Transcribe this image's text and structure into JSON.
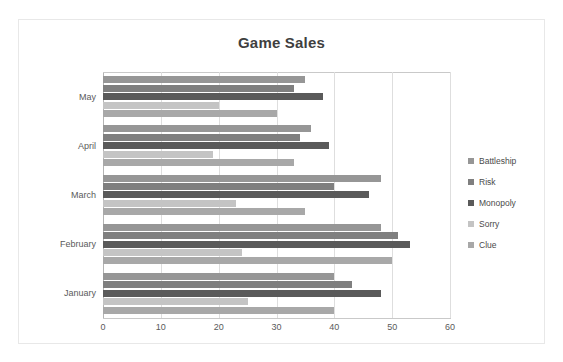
{
  "chart_data": {
    "type": "bar",
    "orientation": "horizontal",
    "title": "Game Sales",
    "xlabel": "",
    "ylabel": "",
    "categories": [
      "January",
      "February",
      "March",
      "April",
      "May"
    ],
    "category_order_top_to_bottom": [
      "May",
      "April",
      "March",
      "February",
      "January"
    ],
    "series": [
      {
        "name": "Battleship",
        "color": "#969696",
        "values": [
          40,
          48,
          48,
          36,
          35
        ]
      },
      {
        "name": "Risk",
        "color": "#7f7f7f",
        "values": [
          43,
          51,
          40,
          34,
          33
        ]
      },
      {
        "name": "Monopoly",
        "color": "#5a5a5a",
        "values": [
          48,
          53,
          46,
          39,
          38
        ]
      },
      {
        "name": "Sorry",
        "color": "#c4c4c4",
        "values": [
          25,
          24,
          23,
          19,
          20
        ]
      },
      {
        "name": "Clue",
        "color": "#a8a8a8",
        "values": [
          40,
          50,
          35,
          33,
          30
        ]
      }
    ],
    "xlim": [
      0,
      60
    ],
    "xticks": [
      0,
      10,
      20,
      30,
      40,
      50,
      60
    ],
    "xtick_labels": [
      "0",
      "10",
      "20",
      "30",
      "40",
      "50",
      "60"
    ],
    "grid": "vertical",
    "legend_position": "right",
    "legend_entries": [
      "Battleship",
      "Risk",
      "Monopoly",
      "Sorry",
      "Clue"
    ]
  },
  "colors": {
    "title_text": "#3f3f3f",
    "axis_text": "#5a5a5a",
    "gridline": "#dedede",
    "frame": "#e8e8e8",
    "plot_background": "#ffffff"
  }
}
